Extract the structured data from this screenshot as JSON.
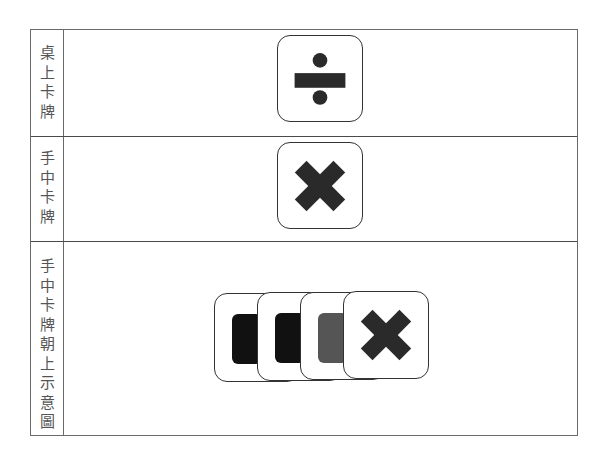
{
  "table": {
    "rows": [
      {
        "label": "桌上卡牌",
        "label_chars": [
          "桌",
          "上",
          "卡",
          "牌"
        ],
        "content": {
          "type": "single-card",
          "icon": "divide-icon"
        }
      },
      {
        "label": "手中卡牌",
        "label_chars": [
          "手",
          "中",
          "卡",
          "牌"
        ],
        "content": {
          "type": "single-card",
          "icon": "multiply-icon"
        }
      },
      {
        "label": "手中卡牌朝上示意圖",
        "label_chars": [
          "手",
          "中",
          "卡",
          "牌",
          "朝",
          "上",
          "示",
          "意",
          "圖"
        ],
        "content": {
          "type": "stacked-cards",
          "cards": [
            {
              "inner": "square",
              "color": "#111111"
            },
            {
              "inner": "square",
              "color": "#111111"
            },
            {
              "inner": "square",
              "color": "#555555"
            },
            {
              "inner": "multiply-icon",
              "color": "#2a2a2a"
            }
          ]
        }
      }
    ]
  },
  "colors": {
    "icon": "#2a2a2a",
    "border": "#333333",
    "label_text": "#555555"
  }
}
